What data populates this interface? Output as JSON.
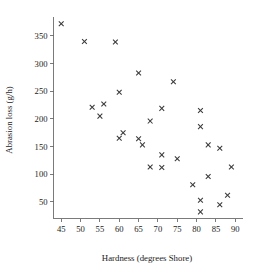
{
  "chart_data": {
    "type": "scatter",
    "title": "",
    "xlabel": "Hardness (degrees Shore)",
    "ylabel": "Abrasion loss (g/h)",
    "xlim": [
      43,
      92
    ],
    "ylim": [
      20,
      385
    ],
    "xticks": [
      45,
      50,
      55,
      60,
      65,
      70,
      75,
      80,
      85,
      90
    ],
    "yticks": [
      50,
      100,
      150,
      200,
      250,
      300,
      350
    ],
    "grid": false,
    "legend": null,
    "marker": "x",
    "marker_color": "#3a3a3a",
    "x": [
      45,
      51,
      59,
      65,
      74,
      60,
      53,
      56,
      55,
      71,
      81,
      68,
      81,
      61,
      60,
      65,
      66,
      86,
      83,
      71,
      75,
      68,
      71,
      89,
      79,
      83,
      81,
      86,
      88,
      81
    ],
    "y": [
      372,
      340,
      339,
      283,
      267,
      248,
      221,
      227,
      205,
      219,
      215,
      196,
      186,
      175,
      165,
      164,
      153,
      147,
      153,
      135,
      128,
      113,
      112,
      113,
      81,
      96,
      53,
      45,
      62,
      32
    ],
    "points": [
      {
        "hardness": 45,
        "loss": 372
      },
      {
        "hardness": 51,
        "loss": 340
      },
      {
        "hardness": 59,
        "loss": 339
      },
      {
        "hardness": 65,
        "loss": 283
      },
      {
        "hardness": 74,
        "loss": 267
      },
      {
        "hardness": 60,
        "loss": 248
      },
      {
        "hardness": 53,
        "loss": 221
      },
      {
        "hardness": 56,
        "loss": 227
      },
      {
        "hardness": 55,
        "loss": 205
      },
      {
        "hardness": 71,
        "loss": 219
      },
      {
        "hardness": 81,
        "loss": 215
      },
      {
        "hardness": 68,
        "loss": 196
      },
      {
        "hardness": 81,
        "loss": 186
      },
      {
        "hardness": 61,
        "loss": 175
      },
      {
        "hardness": 60,
        "loss": 165
      },
      {
        "hardness": 65,
        "loss": 164
      },
      {
        "hardness": 66,
        "loss": 153
      },
      {
        "hardness": 86,
        "loss": 147
      },
      {
        "hardness": 83,
        "loss": 153
      },
      {
        "hardness": 71,
        "loss": 135
      },
      {
        "hardness": 75,
        "loss": 128
      },
      {
        "hardness": 68,
        "loss": 113
      },
      {
        "hardness": 71,
        "loss": 112
      },
      {
        "hardness": 89,
        "loss": 113
      },
      {
        "hardness": 79,
        "loss": 81
      },
      {
        "hardness": 83,
        "loss": 96
      },
      {
        "hardness": 81,
        "loss": 53
      },
      {
        "hardness": 86,
        "loss": 45
      },
      {
        "hardness": 88,
        "loss": 62
      },
      {
        "hardness": 81,
        "loss": 32
      }
    ]
  },
  "axes": {
    "x_title": "Hardness (degrees Shore)",
    "y_title": "Abrasion loss (g/h)",
    "x_tick_labels": [
      "45",
      "50",
      "55",
      "60",
      "65",
      "70",
      "75",
      "80",
      "85",
      "90"
    ],
    "y_tick_labels": [
      "50",
      "100",
      "150",
      "200",
      "250",
      "300",
      "350"
    ]
  },
  "colors": {
    "axis": "#6b6b6b",
    "marker": "#3a3a3a",
    "text": "#1a1a1a",
    "background": "#ffffff"
  }
}
